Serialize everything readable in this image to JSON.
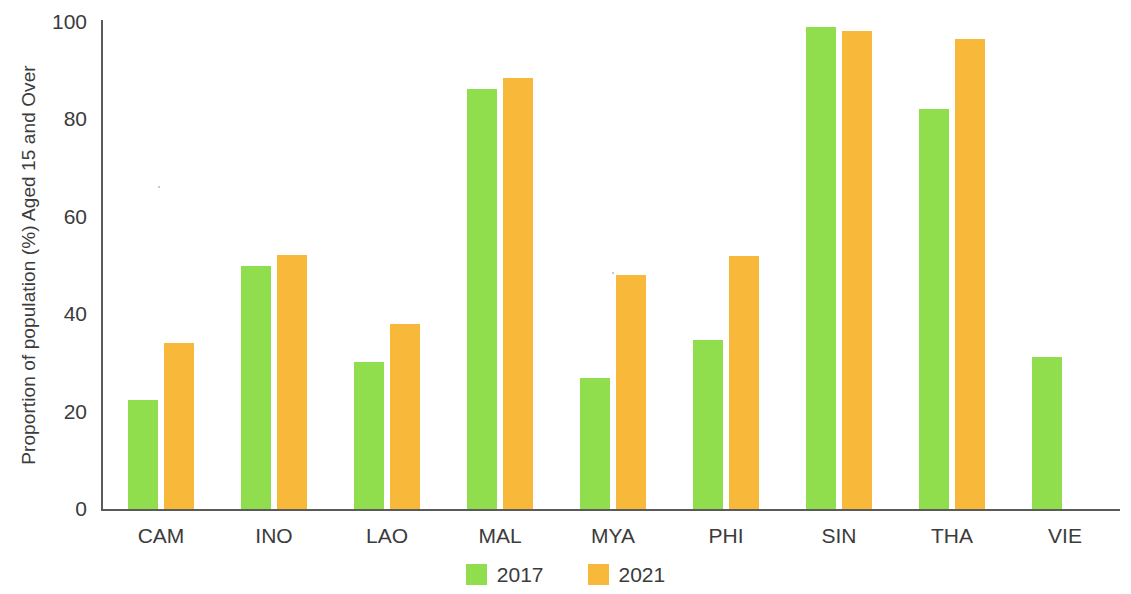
{
  "chart_data": {
    "type": "bar",
    "title": "",
    "xlabel": "",
    "ylabel": "Proportion of population (%) Aged 15 and Over",
    "ylim": [
      0,
      100
    ],
    "yticks": [
      0,
      20,
      40,
      60,
      80,
      100
    ],
    "grid": false,
    "legend_position": "bottom-center",
    "categories": [
      "CAM",
      "INO",
      "LAO",
      "MAL",
      "MYA",
      "PHI",
      "SIN",
      "THA",
      "VIE"
    ],
    "series": [
      {
        "name": "2017",
        "color": "#90dd4e",
        "values": [
          22.3,
          49.8,
          30.2,
          86.2,
          26.9,
          34.7,
          99.0,
          82.1,
          31.2
        ]
      },
      {
        "name": "2021",
        "color": "#f8b93a",
        "values": [
          34.0,
          52.2,
          37.9,
          88.5,
          48.0,
          52.0,
          98.2,
          96.5,
          null
        ]
      }
    ]
  },
  "axis": {
    "y_tick_labels": [
      "100",
      "80",
      "60",
      "40",
      "20",
      "0"
    ],
    "y_axis_title": "Proportion of population (%) Aged 15 and Over"
  },
  "legend": {
    "items": [
      {
        "label": "2017",
        "color": "#90dd4e"
      },
      {
        "label": "2021",
        "color": "#f8b93a"
      }
    ]
  }
}
